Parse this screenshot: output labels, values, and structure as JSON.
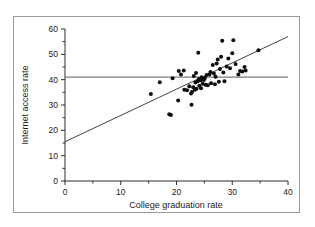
{
  "figure": {
    "border_color": "#9a9a9a",
    "background": "#ffffff"
  },
  "chart_data": {
    "type": "scatter",
    "title": "",
    "xlabel": "College graduation rate",
    "ylabel": "Internet access rate",
    "xlim": [
      0,
      40
    ],
    "ylim": [
      0,
      60
    ],
    "xticks": [
      0,
      10,
      20,
      30,
      40
    ],
    "yticks": [
      0,
      10,
      20,
      30,
      40,
      50,
      60
    ],
    "xtick_labels": [
      "0",
      "10",
      "20",
      "30",
      "40"
    ],
    "ytick_labels": [
      "0",
      "10",
      "20",
      "30",
      "40",
      "50",
      "60"
    ],
    "grid": false,
    "legend": null,
    "marker_color": "#0d0d0d",
    "marker_size": 2.0,
    "regression_line": {
      "name": "least-squares regression line",
      "color": "#2a2a2a",
      "x": [
        0,
        40
      ],
      "y": [
        15.5,
        57.0
      ],
      "slope": 1.0375,
      "intercept": 15.5
    },
    "reference_line": {
      "name": "mean internet access rate line",
      "color": "#7b7b7b",
      "orientation": "horizontal",
      "y": 41.0,
      "x": [
        0,
        40
      ]
    },
    "points": [
      [
        15.4,
        34.3
      ],
      [
        17.0,
        39.0
      ],
      [
        18.7,
        26.3
      ],
      [
        19.0,
        26.1
      ],
      [
        19.3,
        40.6
      ],
      [
        20.3,
        31.8
      ],
      [
        20.4,
        43.4
      ],
      [
        20.8,
        42.0
      ],
      [
        21.3,
        43.6
      ],
      [
        21.4,
        36.0
      ],
      [
        21.9,
        35.8
      ],
      [
        22.3,
        37.4
      ],
      [
        22.6,
        34.5
      ],
      [
        22.7,
        30.1
      ],
      [
        22.8,
        35.2
      ],
      [
        23.0,
        37.0
      ],
      [
        23.1,
        41.4
      ],
      [
        23.3,
        36.0
      ],
      [
        23.4,
        38.9
      ],
      [
        23.5,
        42.6
      ],
      [
        23.6,
        36.4
      ],
      [
        23.8,
        39.4
      ],
      [
        23.9,
        50.6
      ],
      [
        24.0,
        40.3
      ],
      [
        24.1,
        37.6
      ],
      [
        24.2,
        40.0
      ],
      [
        24.3,
        39.8
      ],
      [
        24.4,
        36.6
      ],
      [
        24.5,
        41.0
      ],
      [
        24.6,
        40.5
      ],
      [
        24.7,
        38.4
      ],
      [
        24.9,
        39.9
      ],
      [
        25.1,
        40.7
      ],
      [
        25.2,
        38.0
      ],
      [
        25.4,
        41.8
      ],
      [
        25.6,
        37.8
      ],
      [
        25.9,
        42.0
      ],
      [
        26.1,
        43.0
      ],
      [
        26.2,
        38.6
      ],
      [
        26.5,
        45.8
      ],
      [
        26.7,
        42.4
      ],
      [
        26.9,
        38.2
      ],
      [
        27.0,
        41.2
      ],
      [
        27.2,
        46.4
      ],
      [
        27.4,
        48.0
      ],
      [
        27.6,
        39.2
      ],
      [
        27.8,
        44.2
      ],
      [
        28.0,
        49.0
      ],
      [
        28.2,
        55.4
      ],
      [
        28.4,
        42.8
      ],
      [
        28.6,
        39.4
      ],
      [
        29.0,
        45.2
      ],
      [
        29.3,
        48.4
      ],
      [
        29.6,
        44.5
      ],
      [
        30.0,
        50.4
      ],
      [
        30.2,
        55.6
      ],
      [
        30.6,
        46.2
      ],
      [
        31.1,
        42.0
      ],
      [
        31.4,
        43.4
      ],
      [
        31.8,
        43.2
      ],
      [
        32.2,
        45.0
      ],
      [
        32.4,
        43.6
      ],
      [
        34.7,
        51.6
      ]
    ]
  }
}
